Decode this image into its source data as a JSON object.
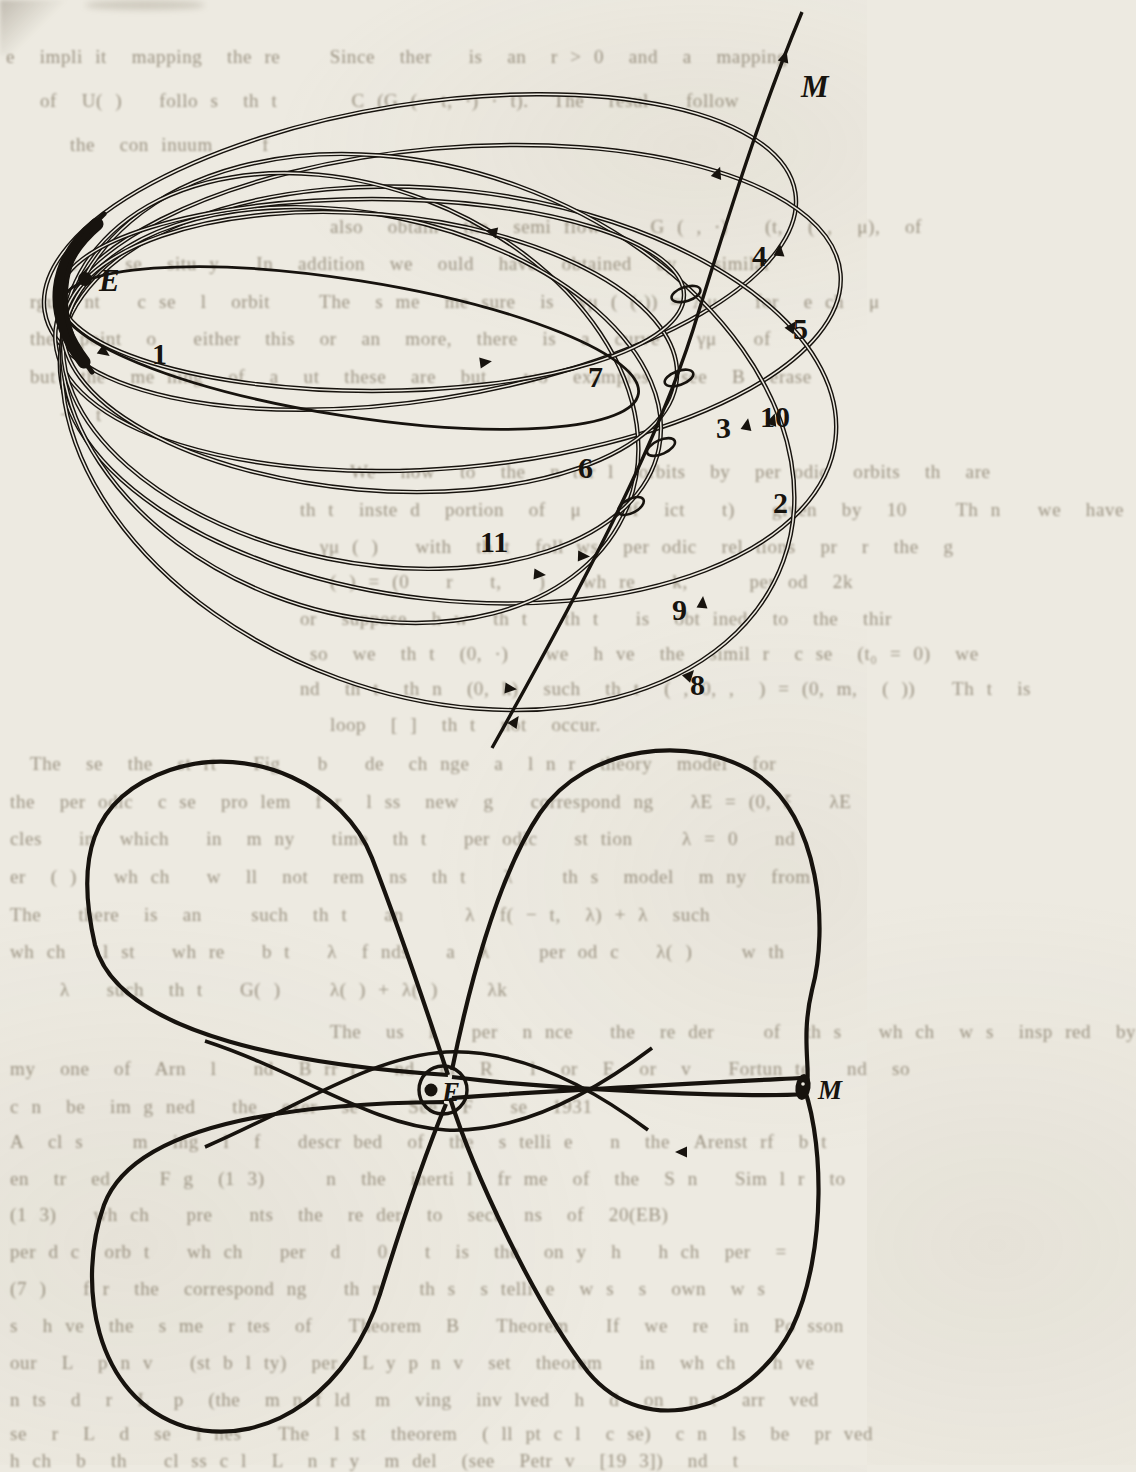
{
  "page": {
    "background": "#edeae1",
    "ink_color": "#17130e",
    "ghost_text_color": "#7d7360"
  },
  "top_figure": {
    "earth_label": "E",
    "moon_label": "M",
    "orbit_labels": [
      "1",
      "2",
      "3",
      "4",
      "5",
      "6",
      "7",
      "8",
      "9",
      "10",
      "11"
    ]
  },
  "bottom_figure": {
    "earth_label": "E",
    "moon_label": "M"
  },
  "ghost_text": {
    "lines": [
      {
        "y": 46,
        "x": 6,
        "text": "e  impli it  mapping  the re    Since  ther   is  an  r > 0  and  a  mapping"
      },
      {
        "y": 90,
        "x": 40,
        "text": "of  U( )   follo s  th t      C (G (− t, ·) · t).  The  resul   follow"
      },
      {
        "y": 134,
        "x": 70,
        "text": "the  con inuum    f"
      },
      {
        "y": 216,
        "x": 330,
        "text": "also  obtain  the  semi flow    G ( , ·)   (t,  ( ,  μ),  of"
      },
      {
        "y": 253,
        "x": 60,
        "text": "he  c se  situ y   In  addition  we  ould  have  obtained  by   similar"
      },
      {
        "y": 291,
        "x": 30,
        "text": "rgum nt   c se  l  orbit    The  s me  me sure  is  γμ ( (·)) = Λμ   for  e ch  μ"
      },
      {
        "y": 328,
        "x": 30,
        "text": "the  point  o   either  this  or  an  more,  there  is  a  curve   γμ   of"
      },
      {
        "y": 366,
        "x": 30,
        "text": "but  the  me ning  of  a  ut  these  are  but   wo  examples  (see  B  erase"
      },
      {
        "y": 404,
        "x": 60,
        "text": "−  t"
      },
      {
        "y": 461,
        "x": 350,
        "text": "We  now  to  the  n tur l  orbits  by  per odic  orbits  th  are"
      },
      {
        "y": 499,
        "x": 300,
        "text": "th t  inste d  portion  of  μ   Of  ict   t)   given  by  10    Th n   we  have"
      },
      {
        "y": 536,
        "x": 320,
        "text": "γμ ( )   with  th t  foll ws  per odic  rel tions  pr  r  the  g"
      },
      {
        "y": 571,
        "x": 330,
        "text": "( ) = (0   r   t,   )   wh re   k,     per od  2k"
      },
      {
        "y": 608,
        "x": 300,
        "text": "or  suppose  h w  th t   th t   is  obt ined  to  the  thir"
      },
      {
        "y": 643,
        "x": 310,
        "text": "so  we  th t  (0, ·)   we  h ve  the  simil r  c se  (t₀ = 0)  we"
      },
      {
        "y": 678,
        "x": 300,
        "text": "nd  th t  th n  (0, k)  such  th t  ( , 0, ,  ) = (0, m,  ( ))   Th t  is"
      },
      {
        "y": 714,
        "x": 330,
        "text": "loop  [ ]  th t  not  occur."
      },
      {
        "y": 753,
        "x": 30,
        "text": "The  se  the  st rt   Fig   b   de  ch nge  a  l n r  theory  model  for"
      },
      {
        "y": 791,
        "x": 10,
        "text": "the  per odic  c se  pro lem  f r  l ss  new  g   correspond ng   λE = (0, ξ   λE"
      },
      {
        "y": 828,
        "x": 10,
        "text": "cles   in  which   in  m ny   time  th t   per odic   st tion    λ = 0   nd"
      },
      {
        "y": 866,
        "x": 10,
        "text": "er  ( )   wh ch   w  ll  not  rem  ns  th t   λ    th s  model  m ny  from"
      },
      {
        "y": 904,
        "x": 10,
        "text": "The   there  is  an    such  th t   an     λ  f( − t,  λ) + λ  such"
      },
      {
        "y": 941,
        "x": 10,
        "text": "wh ch   l st   wh re   b t   λ  f nds   a  λ    per od c   λ( )    w th"
      },
      {
        "y": 979,
        "x": 60,
        "text": "λ   such  th t   G( )    λ( ) + λ( )    λk"
      },
      {
        "y": 1021,
        "x": 330,
        "text": "The  us  l   per  n nce   the  re der    of  th s   wh ch  w s  insp red  by"
      },
      {
        "y": 1058,
        "x": 10,
        "text": "my  one  of  Arn  l   nd  B rr r   nd  in  R   l  or  E  or  v   Fortun te   nd  so"
      },
      {
        "y": 1096,
        "x": 10,
        "text": "c n  be  im g ned   the  exer  se    See  F   se  1931"
      },
      {
        "y": 1131,
        "x": 10,
        "text": "A  cl s    m  ing  l  f   descr bed  of  the  s telli e   n  the  Arenst rf  b t"
      },
      {
        "y": 1168,
        "x": 10,
        "text": "en  tr  ed    F g  (1 3)     n  the  inerti l  fr me  of  the  S n   Sim l r  to"
      },
      {
        "y": 1204,
        "x": 10,
        "text": "(1 3)   wh ch   pre   nts  the  re der  to  sect  ns  of  20(EB)"
      },
      {
        "y": 1241,
        "x": 10,
        "text": "per d c  orb t   wh ch   per  d   0   t  is  the  on y  h   h ch  per  ="
      },
      {
        "y": 1278,
        "x": 10,
        "text": "(7 )   f r  the  correspond ng   th n   th s  s telli e  w s  s  own  w s"
      },
      {
        "y": 1315,
        "x": 10,
        "text": "s  h ve  the  s me  r tes  of   Theorem  B   Theorem   If  we  re  in  Po sson"
      },
      {
        "y": 1352,
        "x": 10,
        "text": "our  L  p n v   (st b l ty)  per  L y p n v  set  theorem   in  wh ch   h ve"
      },
      {
        "y": 1389,
        "x": 10,
        "text": "n ts  d  r  L  p  (the  m n f ld  m  ving  inv lved  h  d  on  n t  arr  ved"
      },
      {
        "y": 1423,
        "x": 10,
        "text": "se  r  L  d  se  l nes   The  l st  theorem  ( ll pt c l  c se)  c n  ls  be  pr ved"
      },
      {
        "y": 1450,
        "x": 10,
        "text": "h ch  b  th   cl ss c l  L  n r y  m del  (see  Petr v  [19 3])  nd  t"
      }
    ]
  }
}
